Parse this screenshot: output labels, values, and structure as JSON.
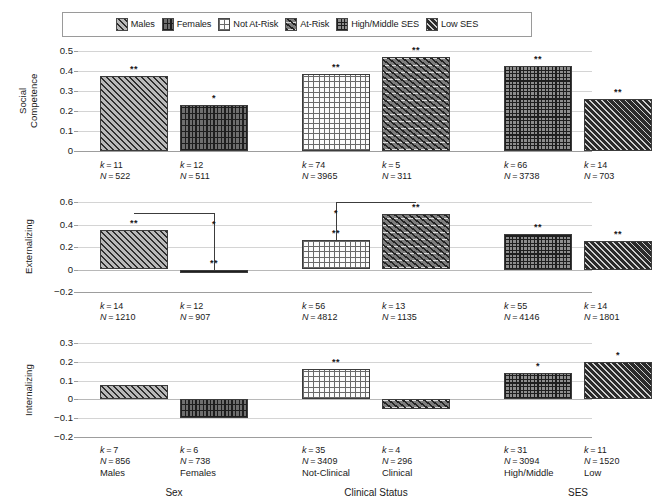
{
  "legend": {
    "items": [
      {
        "label": "Males",
        "pattern": "pat-males"
      },
      {
        "label": "Females",
        "pattern": "pat-females"
      },
      {
        "label": "Not At-Risk",
        "pattern": "pat-notatrisk"
      },
      {
        "label": "At-Risk",
        "pattern": "pat-atrisk"
      },
      {
        "label": "High/Middle SES",
        "pattern": "pat-highmid"
      },
      {
        "label": "Low SES",
        "pattern": "pat-lowses"
      }
    ]
  },
  "group_labels": [
    "Sex",
    "Clinical Status",
    "SES"
  ],
  "category_labels": [
    "Males",
    "Females",
    "Not-Clinical",
    "Clinical",
    "High/Middle",
    "Low"
  ],
  "chart_data": {
    "type": "bar",
    "title": "",
    "xlabel": "",
    "grid": true,
    "legend_position": "top",
    "panels": [
      {
        "ylabel": "Social\nCompetence",
        "ylabel_lines": [
          "Social",
          "Competence"
        ],
        "ylim": [
          0,
          0.5
        ],
        "yticks": [
          0,
          0.1,
          0.2,
          0.3,
          0.4,
          0.5
        ],
        "ytick_labels": [
          "0",
          "0.1",
          "0.2",
          "0.3",
          "0.4",
          "0.5"
        ],
        "bars": [
          {
            "category": "Males",
            "pattern": "pat-males",
            "value": 0.375,
            "sig": "**",
            "k": "11",
            "N": "522"
          },
          {
            "category": "Females",
            "pattern": "pat-females",
            "value": 0.232,
            "sig": "*",
            "k": "12",
            "N": "511"
          },
          {
            "category": "Not At-Risk",
            "pattern": "pat-notatrisk",
            "value": 0.384,
            "sig": "**",
            "k": "74",
            "N": "3965"
          },
          {
            "category": "At-Risk",
            "pattern": "pat-atrisk",
            "value": 0.47,
            "sig": "**",
            "k": "5",
            "N": "311"
          },
          {
            "category": "High/Middle SES",
            "pattern": "pat-highmid",
            "value": 0.423,
            "sig": "**",
            "k": "66",
            "N": "3738"
          },
          {
            "category": "Low SES",
            "pattern": "pat-lowses",
            "value": 0.262,
            "sig": "**",
            "k": "14",
            "N": "703"
          }
        ],
        "connectors": []
      },
      {
        "ylabel": "Externalizing",
        "ylabel_lines": [
          "Externalizing"
        ],
        "ylim": [
          -0.2,
          0.6
        ],
        "yticks": [
          -0.2,
          0,
          0.2,
          0.4,
          0.6
        ],
        "ytick_labels": [
          "−0.2",
          "0",
          "0.2",
          "0.4",
          "0.6"
        ],
        "bars": [
          {
            "category": "Males",
            "pattern": "pat-males",
            "value": 0.353,
            "sig": "**",
            "k": "14",
            "N": "1210"
          },
          {
            "category": "Females",
            "pattern": "pat-females",
            "value": -0.018,
            "sig": "**",
            "k": "12",
            "N": "907"
          },
          {
            "category": "Not At-Risk",
            "pattern": "pat-notatrisk",
            "value": 0.263,
            "sig": "**",
            "k": "56",
            "N": "4812"
          },
          {
            "category": "At-Risk",
            "pattern": "pat-atrisk",
            "value": 0.497,
            "sig": "**",
            "k": "13",
            "N": "1135"
          },
          {
            "category": "High/Middle SES",
            "pattern": "pat-highmid",
            "value": 0.32,
            "sig": "**",
            "k": "55",
            "N": "4146"
          },
          {
            "category": "Low SES",
            "pattern": "pat-lowses",
            "value": 0.255,
            "sig": "**",
            "k": "14",
            "N": "1801"
          }
        ],
        "connectors": [
          {
            "from_bar": 0,
            "to_bar": 1,
            "top_value": 0.5,
            "sig": "*"
          },
          {
            "from_bar": 3,
            "to_bar": 2,
            "top_value": 0.6,
            "sig": "*"
          }
        ]
      },
      {
        "ylabel": "Internalizing",
        "ylabel_lines": [
          "Internalizing"
        ],
        "ylim": [
          -0.2,
          0.3
        ],
        "yticks": [
          -0.2,
          -0.1,
          0,
          0.1,
          0.2,
          0.3
        ],
        "ytick_labels": [
          "−0.2",
          "−0.1",
          "0",
          "0.1",
          "0.2",
          "0.3"
        ],
        "bars": [
          {
            "category": "Males",
            "pattern": "pat-males",
            "value": 0.074,
            "sig": "",
            "k": "7",
            "N": "856"
          },
          {
            "category": "Females",
            "pattern": "pat-females",
            "value": -0.1,
            "sig": "",
            "k": "6",
            "N": "738"
          },
          {
            "category": "Not At-Risk",
            "pattern": "pat-notatrisk",
            "value": 0.161,
            "sig": "**",
            "k": "35",
            "N": "3409"
          },
          {
            "category": "At-Risk",
            "pattern": "pat-atrisk",
            "value": -0.05,
            "sig": "",
            "k": "4",
            "N": "296"
          },
          {
            "category": "High/Middle SES",
            "pattern": "pat-highmid",
            "value": 0.142,
            "sig": "*",
            "k": "31",
            "N": "3094"
          },
          {
            "category": "Low SES",
            "pattern": "pat-lowses",
            "value": 0.2,
            "sig": "*",
            "k": "11",
            "N": "1520"
          }
        ],
        "connectors": []
      }
    ]
  }
}
